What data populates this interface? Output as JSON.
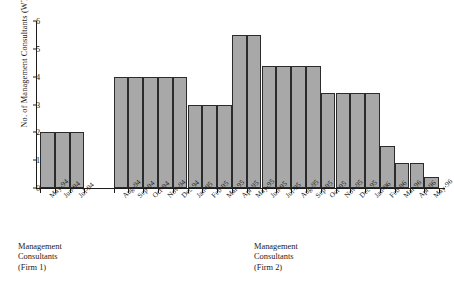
{
  "chart_data": {
    "type": "bar",
    "title": "",
    "xlabel": "",
    "ylabel": "No. of Management Consultants (WTEs)",
    "ylim": [
      0,
      6
    ],
    "yticks": [
      0,
      1,
      2,
      3,
      4,
      5,
      6
    ],
    "ytick_labels": [
      "0",
      "1",
      "2",
      "3",
      "4",
      "5",
      "6"
    ],
    "grid": false,
    "legend": "none",
    "bar_color": "#a8a8a8",
    "bar_edge_color": "#2b2b2b",
    "groups": [
      {
        "name": "firm-1",
        "caption": [
          "Management",
          "Consultants",
          "(Firm 1)"
        ],
        "categories": [
          "May-94",
          "Jun-94",
          "Jul-94"
        ],
        "values": [
          2,
          2,
          2
        ]
      },
      {
        "name": "firm-2",
        "caption": [
          "Management",
          "Consultants",
          "(Firm 2)"
        ],
        "categories": [
          "Aug-94",
          "Sep-94",
          "Oct-94",
          "Nov-94",
          "Dec-94",
          "Jan-95",
          "Feb-95",
          "Mar-95",
          "Apr-95",
          "May-95",
          "Jun-95",
          "Jul-95",
          "Aug-95",
          "Sep-95",
          "Oct-95",
          "Nov-95",
          "Dec-95",
          "Jan-96",
          "Feb-96",
          "Mar-96",
          "Apr-96",
          "May-96"
        ],
        "values": [
          4,
          4,
          4,
          4,
          4,
          3,
          3,
          3,
          5.5,
          5.5,
          4.4,
          4.4,
          4.4,
          4.4,
          3.4,
          3.4,
          3.4,
          3.4,
          1.5,
          0.9,
          0.9,
          0.4
        ]
      }
    ]
  }
}
